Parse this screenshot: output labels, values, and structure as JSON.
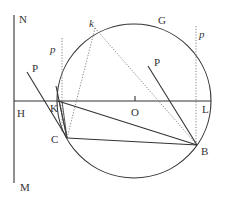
{
  "diagram": {
    "type": "geometric-construction",
    "colors": {
      "stroke": "#333333",
      "dotted": "#777777",
      "background": "#ffffff"
    },
    "circle": {
      "center_label": "O",
      "top_label": "G"
    },
    "labels": {
      "N": "N",
      "M": "M",
      "H": "H",
      "O": "O",
      "L": "L",
      "G": "G",
      "B": "B",
      "C": "C",
      "K": "K",
      "k": "k",
      "P_left": "P",
      "P_right": "P",
      "p_left": "p",
      "p_right": "p"
    },
    "points": [
      {
        "name": "N",
        "x": 14,
        "y": 15
      },
      {
        "name": "M",
        "x": 14,
        "y": 183
      },
      {
        "name": "H",
        "x": 14,
        "y": 101
      },
      {
        "name": "O",
        "x": 135,
        "y": 101
      },
      {
        "name": "L",
        "x": 211,
        "y": 101
      },
      {
        "name": "G",
        "x": 135,
        "y": 24
      },
      {
        "name": "B",
        "x": 197,
        "y": 145
      },
      {
        "name": "C",
        "x": 67,
        "y": 138
      },
      {
        "name": "K",
        "x": 58,
        "y": 101
      },
      {
        "name": "k",
        "x": 95,
        "y": 30
      }
    ]
  }
}
